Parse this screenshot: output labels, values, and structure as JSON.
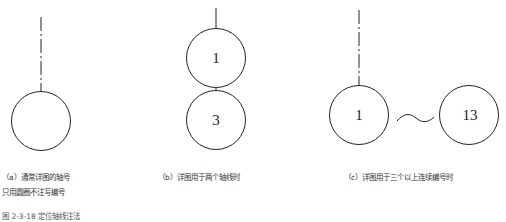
{
  "figure": {
    "title": "图 2-3-18  定位轴线注法",
    "panels": [
      {
        "id": "a",
        "caption_line1": "（a）通常详图的轴号",
        "caption_line2": "只用圆圈不注写编号",
        "circles": []
      },
      {
        "id": "b",
        "caption_line1": "（b）详图用于两个轴线时",
        "circles": [
          "1",
          "3"
        ]
      },
      {
        "id": "c",
        "caption_line1": "（c）详图用于三个以上连续编号时",
        "circles": [
          "1",
          "13"
        ],
        "connector": "~"
      }
    ]
  },
  "colors": {
    "line": "#222222",
    "background": "#ffffff"
  }
}
